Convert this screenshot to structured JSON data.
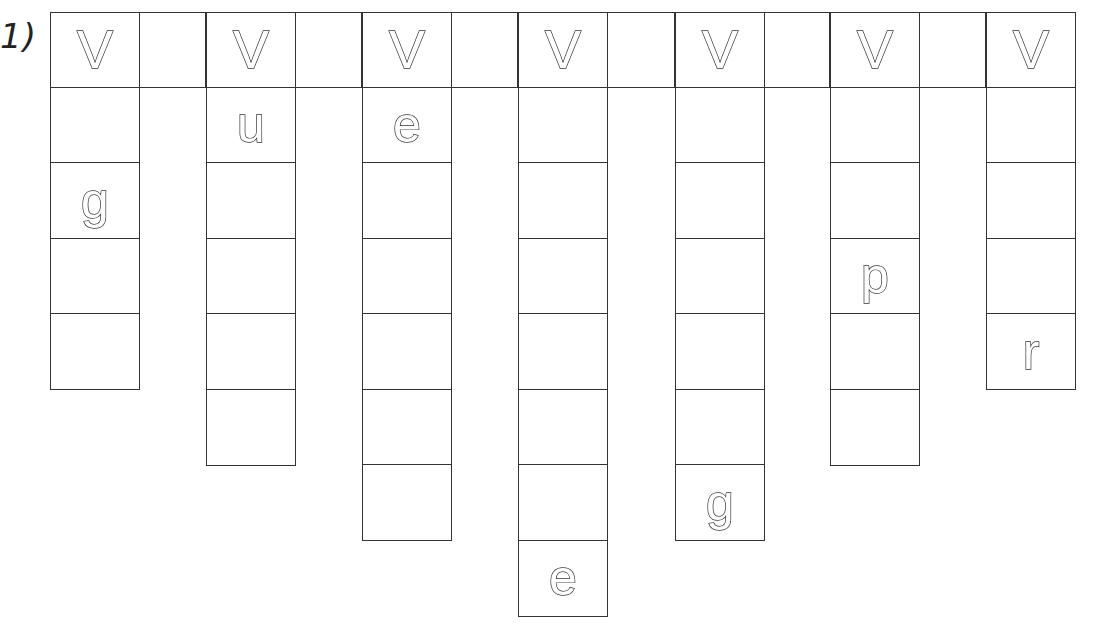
{
  "worksheet": {
    "exercise_label": "1)",
    "header_letter": "V",
    "columns": [
      {
        "index": 1,
        "head": "V",
        "cells": [
          "",
          "g",
          "",
          ""
        ]
      },
      {
        "index": 2,
        "head": "V",
        "cells": [
          "u",
          "",
          "",
          "",
          ""
        ]
      },
      {
        "index": 3,
        "head": "V",
        "cells": [
          "e",
          "",
          "",
          "",
          "",
          ""
        ]
      },
      {
        "index": 4,
        "head": "V",
        "cells": [
          "",
          "",
          "",
          "",
          "",
          "",
          "e"
        ]
      },
      {
        "index": 5,
        "head": "V",
        "cells": [
          "",
          "",
          "",
          "",
          "",
          "g"
        ]
      },
      {
        "index": 6,
        "head": "V",
        "cells": [
          "",
          "",
          "p",
          "",
          ""
        ]
      },
      {
        "index": 7,
        "head": "V",
        "cells": [
          "",
          "",
          "",
          "r"
        ]
      }
    ]
  },
  "colors": {
    "line": "#333333",
    "background": "#ffffff"
  }
}
